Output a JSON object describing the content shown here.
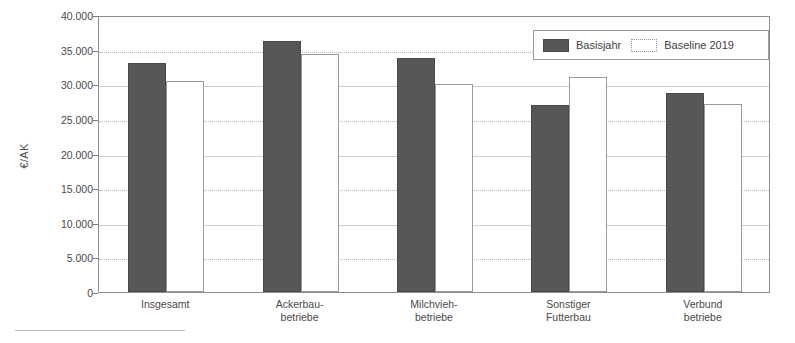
{
  "chart_data": {
    "type": "bar",
    "title": "",
    "subtitle": "",
    "xlabel": "",
    "ylabel": "€/AK",
    "ylim": [
      0,
      40000
    ],
    "ytick_step": 5000,
    "ytick_labels": [
      "0",
      "5.000",
      "10.000",
      "15.000",
      "20.000",
      "25.000",
      "30.000",
      "35.000",
      "40.000"
    ],
    "ytick_values": [
      0,
      5000,
      10000,
      15000,
      20000,
      25000,
      30000,
      35000,
      40000
    ],
    "grid": true,
    "grid_axis": "y",
    "legend_position": "top-right",
    "categories": [
      "Insgesamt",
      "Ackerbau-\nbetriebe",
      "Milchvieh-\nbetriebe",
      "Sonstiger\nFutterbau",
      "Verbund\nbetriebe"
    ],
    "series": [
      {
        "name": "Basisjahr",
        "color": "#575757",
        "values": [
          33000,
          36200,
          33800,
          27000,
          28700
        ]
      },
      {
        "name": "Baseline 2019",
        "color": "#ffffff",
        "values": [
          30500,
          34400,
          30000,
          31000,
          27100
        ]
      }
    ]
  },
  "legend": {
    "items": [
      {
        "label": "Basisjahr",
        "swatch": "dark-filled-swatch"
      },
      {
        "label": "Baseline 2019",
        "swatch": "light-outline-swatch"
      }
    ]
  },
  "footnote": {
    "rule": "horizontal-separator-line",
    "text": ""
  }
}
